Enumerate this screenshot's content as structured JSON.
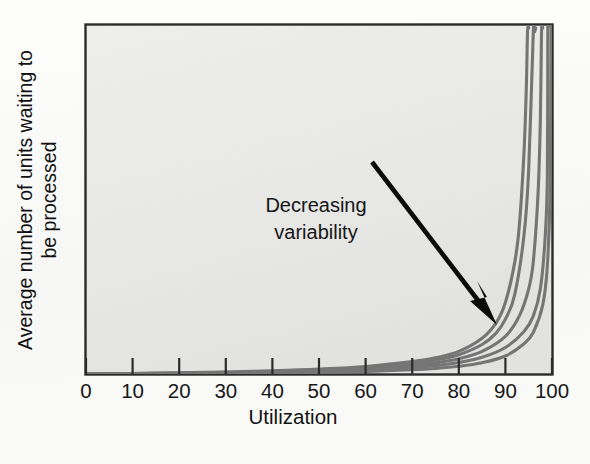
{
  "figure": {
    "background_color": "#fbfbfa",
    "plot_background_color": "#e9e9e7",
    "frame_color": "#2b2b2b",
    "curve_color": "#757575",
    "arrow_color": "#0b0b0b",
    "text_color": "#171717"
  },
  "chart_data": {
    "type": "line",
    "title": "",
    "subtitle": "",
    "xlabel": "Utilization",
    "ylabel": "Average number of units waiting to be processed",
    "ylabel_lines": [
      "Average number of units waiting to",
      "be processed"
    ],
    "xlim": [
      0,
      100
    ],
    "ylim": [
      0,
      1
    ],
    "grid": false,
    "legend": false,
    "legend_position": "none",
    "xticks": [
      0,
      10,
      20,
      30,
      40,
      50,
      60,
      70,
      80,
      90,
      100
    ],
    "xtick_labels": [
      "0",
      "10",
      "20",
      "30",
      "40",
      "50",
      "60",
      "70",
      "80",
      "90",
      "100"
    ],
    "yticks": [],
    "ytick_labels": [],
    "series": [
      {
        "name": "highest variability",
        "asymptote": 95,
        "scale": 0.0115,
        "x": [
          0,
          10,
          20,
          30,
          40,
          50,
          60,
          70,
          75,
          80,
          85,
          88,
          90,
          92,
          93,
          94,
          94.5
        ],
        "y": [
          0.0,
          0.031,
          0.071,
          0.125,
          0.197,
          0.3,
          0.46,
          0.76,
          0.99,
          1.38,
          2.18,
          3.12,
          4.37,
          6.82,
          9.1,
          13.6,
          17.6
        ]
      },
      {
        "name": "high variability",
        "asymptote": 96.5,
        "scale": 0.0105,
        "x": [
          0,
          10,
          20,
          30,
          40,
          50,
          60,
          70,
          75,
          80,
          85,
          88,
          90,
          92,
          94,
          95,
          96
        ],
        "y": [
          0.0,
          0.024,
          0.056,
          0.1,
          0.16,
          0.25,
          0.39,
          0.65,
          0.85,
          1.18,
          1.8,
          2.5,
          3.35,
          4.85,
          8.5,
          12.5,
          21.0
        ]
      },
      {
        "name": "medium variability",
        "asymptote": 98,
        "scale": 0.0098,
        "x": [
          0,
          10,
          20,
          30,
          40,
          50,
          60,
          70,
          75,
          80,
          85,
          90,
          93,
          95,
          96,
          97,
          97.5
        ],
        "y": [
          0.0,
          0.018,
          0.043,
          0.078,
          0.126,
          0.2,
          0.31,
          0.52,
          0.68,
          0.93,
          1.38,
          2.3,
          3.55,
          5.2,
          6.9,
          11.0,
          15.5
        ]
      },
      {
        "name": "low variability",
        "asymptote": 99.2,
        "scale": 0.009,
        "x": [
          0,
          10,
          20,
          30,
          40,
          50,
          60,
          70,
          75,
          80,
          85,
          90,
          94,
          96,
          97.5,
          98.5,
          99
        ],
        "y": [
          0.0,
          0.013,
          0.031,
          0.057,
          0.093,
          0.148,
          0.232,
          0.39,
          0.51,
          0.7,
          1.02,
          1.62,
          2.6,
          3.55,
          5.2,
          8.2,
          12.0
        ]
      },
      {
        "name": "lowest variability",
        "asymptote": 100,
        "scale": 0.0082,
        "x": [
          0,
          10,
          20,
          30,
          40,
          50,
          60,
          70,
          75,
          80,
          85,
          90,
          94,
          96,
          98,
          99,
          99.6
        ],
        "y": [
          0.0,
          0.008,
          0.019,
          0.036,
          0.059,
          0.095,
          0.15,
          0.26,
          0.34,
          0.47,
          0.69,
          1.1,
          1.85,
          2.55,
          4.2,
          6.6,
          11.5
        ]
      }
    ],
    "annotations": [
      {
        "name": "decreasing-variability",
        "lines": [
          "Decreasing",
          "variability"
        ],
        "text": "Decreasing variability",
        "arrow_from": [
          60,
          0.58
        ],
        "arrow_to": [
          88,
          0.12
        ]
      }
    ]
  }
}
